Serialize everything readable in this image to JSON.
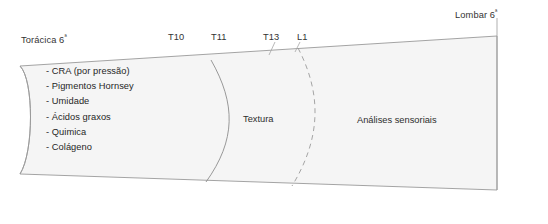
{
  "diagram": {
    "type": "tapered-band-segmented",
    "title_shown": false,
    "colors": {
      "band_fill": "#f5f5f5",
      "band_stroke": "#9a9a9a",
      "divider_solid": "#8d8d8d",
      "divider_dashed": "#9b9b9b",
      "leader_line": "#a6a6a6",
      "text": "#2b2b2b",
      "background": "#ffffff"
    },
    "end_labels": {
      "left": {
        "text": "Torácica 6",
        "ordinal": "ª"
      },
      "right": {
        "text": "Lombar 6",
        "ordinal": "ª"
      }
    },
    "vertebra_ticks": [
      {
        "label": "T10"
      },
      {
        "label": "T11"
      },
      {
        "label": "T13"
      },
      {
        "label": "L1"
      }
    ],
    "segments": [
      {
        "name": "segment-analyses-list",
        "label": "",
        "items": [
          "- CRA (por pressão)",
          "- Pigmentos Hornsey",
          "- Umidade",
          "- Ácidos graxos",
          "- Quimica",
          "- Colágeno"
        ]
      },
      {
        "name": "segment-texture",
        "label": "Textura",
        "items": []
      },
      {
        "name": "segment-sensory",
        "label": "Análises sensoriais",
        "items": []
      }
    ]
  }
}
